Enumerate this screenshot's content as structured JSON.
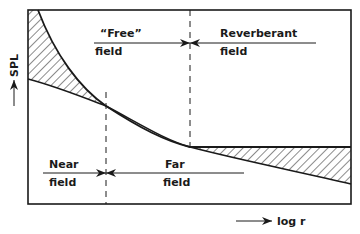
{
  "diagram": {
    "type": "sound-field-regions",
    "axes": {
      "y_label": "SPL",
      "x_label": "log r"
    },
    "regions_top": [
      {
        "line1": "“Free”",
        "line2": "field"
      },
      {
        "line1": "Reverberant",
        "line2": "field"
      }
    ],
    "regions_bottom": [
      {
        "line1": "Near",
        "line2": "field"
      },
      {
        "line1": "Far",
        "line2": "field"
      }
    ],
    "colors": {
      "ink": "#1a1a1a",
      "background": "#ffffff"
    }
  }
}
